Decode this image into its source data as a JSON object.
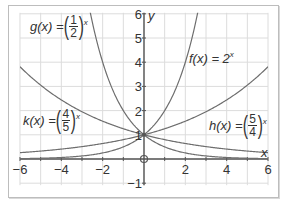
{
  "chart_data": {
    "type": "line",
    "title": "",
    "xlabel": "x",
    "ylabel": "y",
    "xlim": [
      -6,
      6
    ],
    "ylim": [
      -1,
      6
    ],
    "grid": true,
    "x_ticks": [
      -6,
      -4,
      -2,
      2,
      4,
      6
    ],
    "y_ticks": [
      -1,
      1,
      2,
      3,
      4,
      5,
      6
    ],
    "series": [
      {
        "name": "f(x) = 2^x",
        "base": 2,
        "label_prefix": "f(x) = 2",
        "label_sup": "x"
      },
      {
        "name": "g(x) = (1/2)^x",
        "base": 0.5,
        "label_prefix": "g(x) =",
        "num": "1",
        "den": "2",
        "label_sup": "x"
      },
      {
        "name": "h(x) = (5/4)^x",
        "base": 1.25,
        "label_prefix": "h(x) =",
        "num": "5",
        "den": "4",
        "label_sup": "x"
      },
      {
        "name": "k(x) = (4/5)^x",
        "base": 0.8,
        "label_prefix": "k(x) =",
        "num": "4",
        "den": "5",
        "label_sup": "x"
      }
    ],
    "annotations": [
      "open circle at origin (0,0)",
      "point (0,1) common intersection"
    ]
  },
  "colors": {
    "curve": "#6e6e6e",
    "axis": "#555555",
    "grid": "#dcdcdc",
    "frame": "#bdbdbd"
  }
}
